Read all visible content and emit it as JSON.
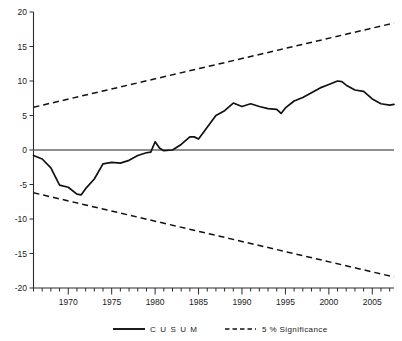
{
  "chart_data": {
    "type": "line",
    "title": "",
    "xlabel": "",
    "ylabel": "",
    "xlim": [
      1966,
      2007.5
    ],
    "ylim": [
      -20,
      20
    ],
    "grid": false,
    "legend_position": "bottom",
    "y_ticks": [
      20,
      15,
      10,
      5,
      0,
      -5,
      -10,
      -15,
      -20
    ],
    "y_tick_labels": [
      "20",
      "15",
      "10",
      "5",
      "0",
      "-5",
      "-10",
      "-15",
      "-20"
    ],
    "x_ticks": [
      1970,
      1975,
      1980,
      1985,
      1990,
      1995,
      2000,
      2005
    ],
    "x_tick_labels": [
      "1970",
      "1975",
      "1980",
      "1985",
      "1990",
      "1995",
      "2000",
      "2005"
    ],
    "x_minor_tick_step": 1,
    "zero_line": 0,
    "series": [
      {
        "name": "CUSUM",
        "style": "solid",
        "color": "#111111",
        "x": [
          1966,
          1967,
          1968,
          1969,
          1970,
          1971,
          1971.5,
          1972,
          1973,
          1974,
          1975,
          1976,
          1977,
          1978,
          1979,
          1979.5,
          1980,
          1980.5,
          1981,
          1982,
          1983,
          1984,
          1984.5,
          1985,
          1986,
          1987,
          1988,
          1989,
          1990,
          1991,
          1992,
          1993,
          1994,
          1994.5,
          1995,
          1996,
          1997,
          1998,
          1999,
          2000,
          2001,
          2001.5,
          2002,
          2003,
          2004,
          2005,
          2006,
          2007,
          2007.5
        ],
        "y": [
          -0.8,
          -1.3,
          -2.6,
          -5.1,
          -5.4,
          -6.4,
          -6.5,
          -5.6,
          -4.2,
          -2.0,
          -1.8,
          -1.9,
          -1.5,
          -0.8,
          -0.4,
          -0.3,
          1.2,
          0.3,
          -0.1,
          0.0,
          0.8,
          1.9,
          1.9,
          1.6,
          3.3,
          5.0,
          5.7,
          6.8,
          6.3,
          6.7,
          6.3,
          6.0,
          5.9,
          5.3,
          6.1,
          7.1,
          7.6,
          8.3,
          9.0,
          9.5,
          10.0,
          9.9,
          9.4,
          8.7,
          8.5,
          7.4,
          6.7,
          6.5,
          6.6
        ]
      },
      {
        "name": "5 % Significance",
        "style": "dashed",
        "color": "#111111",
        "x": [
          1966,
          2007.5
        ],
        "y": [
          6.2,
          18.4
        ]
      },
      {
        "name": "5 % Significance",
        "style": "dashed",
        "color": "#111111",
        "x": [
          1966,
          2007.5
        ],
        "y": [
          -6.2,
          -18.4
        ]
      }
    ],
    "legend": [
      {
        "label": "C U S U M",
        "style": "solid"
      },
      {
        "label": "5 % Significance",
        "style": "dashed"
      }
    ]
  },
  "legend": {
    "cusum_label": "C U S U M",
    "significance_label": "5 % Significance"
  },
  "colors": {
    "line": "#111111",
    "zero_line": "#6b6b6b",
    "axis": "#2b2b2b",
    "background": "#ffffff"
  }
}
